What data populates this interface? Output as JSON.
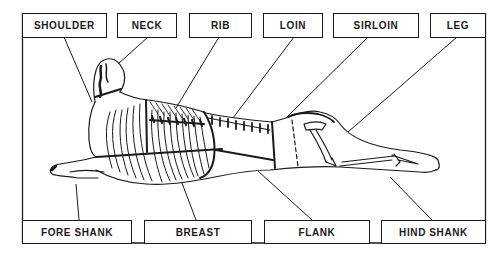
{
  "diagram": {
    "colors": {
      "ink": "#1a1a1a",
      "background": "#ffffff"
    },
    "top_labels": [
      {
        "id": "shoulder",
        "text": "SHOULDER",
        "x": 22,
        "w": 85,
        "pointer": [
          [
            64,
            37
          ],
          [
            92,
            102
          ]
        ]
      },
      {
        "id": "neck",
        "text": "NECK",
        "x": 117,
        "w": 60,
        "pointer": [
          [
            148,
            37
          ],
          [
            118,
            64
          ]
        ]
      },
      {
        "id": "rib",
        "text": "RIB",
        "x": 189,
        "w": 63,
        "pointer": [
          [
            219,
            37
          ],
          [
            176,
            108
          ]
        ]
      },
      {
        "id": "loin",
        "text": "LOIN",
        "x": 263,
        "w": 60,
        "pointer": [
          [
            294,
            37
          ],
          [
            233,
            118
          ]
        ]
      },
      {
        "id": "sirloin",
        "text": "SIRLOIN",
        "x": 333,
        "w": 86,
        "pointer": [
          [
            368,
            37
          ],
          [
            286,
            118
          ]
        ]
      },
      {
        "id": "leg",
        "text": "LEG",
        "x": 430,
        "w": 56,
        "pointer": [
          [
            457,
            37
          ],
          [
            348,
            132
          ]
        ]
      }
    ],
    "bottom_labels": [
      {
        "id": "fore-shank",
        "text": "FORE SHANK",
        "x": 22,
        "w": 110,
        "pointer": [
          [
            79,
            220
          ],
          [
            76,
            184
          ]
        ]
      },
      {
        "id": "breast",
        "text": "BREAST",
        "x": 144,
        "w": 108,
        "pointer": [
          [
            196,
            220
          ],
          [
            182,
            183
          ]
        ]
      },
      {
        "id": "flank",
        "text": "FLANK",
        "x": 264,
        "w": 106,
        "pointer": [
          [
            312,
            220
          ],
          [
            258,
            171
          ]
        ]
      },
      {
        "id": "hind-shank",
        "text": "HIND SHANK",
        "x": 381,
        "w": 105,
        "pointer": [
          [
            432,
            220
          ],
          [
            390,
            177
          ]
        ]
      }
    ]
  }
}
